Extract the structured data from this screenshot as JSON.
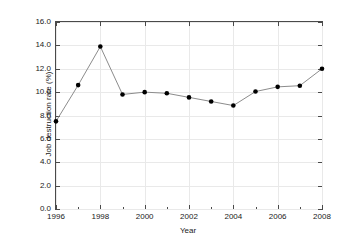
{
  "chart_data": {
    "type": "line",
    "title": "",
    "xlabel": "Year",
    "ylabel": "Job destruction rate (%)",
    "x": [
      1996,
      1997,
      1998,
      1999,
      2000,
      2001,
      2002,
      2003,
      2004,
      2005,
      2006,
      2007,
      2008
    ],
    "values": [
      7.5,
      10.6,
      13.9,
      9.8,
      10.0,
      9.9,
      9.55,
      9.2,
      8.85,
      10.05,
      10.45,
      10.55,
      12.0
    ],
    "series": [
      {
        "name": "Job destruction rate",
        "values": [
          7.5,
          10.6,
          13.9,
          9.8,
          10.0,
          9.9,
          9.55,
          9.2,
          8.85,
          10.05,
          10.45,
          10.55,
          12.0
        ]
      }
    ],
    "xlim": [
      1996,
      2008
    ],
    "ylim": [
      0.0,
      16.0
    ],
    "ytick_values": [
      0.0,
      2.0,
      4.0,
      6.0,
      8.0,
      10.0,
      12.0,
      14.0,
      16.0
    ],
    "ytick_labels": [
      "0.0",
      "2.0",
      "4.0",
      "6.0",
      "8.0",
      "10.0",
      "12.0",
      "14.0",
      "16.0"
    ],
    "xtick_values": [
      1996,
      1998,
      2000,
      2002,
      2004,
      2006,
      2008
    ],
    "xtick_labels": [
      "1996",
      "1998",
      "2000",
      "2002",
      "2004",
      "2006",
      "2008"
    ],
    "xtick_minor_values": [
      1997,
      1999,
      2001,
      2003,
      2005,
      2007
    ],
    "grid": true,
    "legend": null,
    "line_color": "#8c8c8c",
    "marker_color": "#000000",
    "grid_color": "#e9e9e9",
    "axis_color": "#4a4a4a",
    "background_color": "#ffffff"
  }
}
